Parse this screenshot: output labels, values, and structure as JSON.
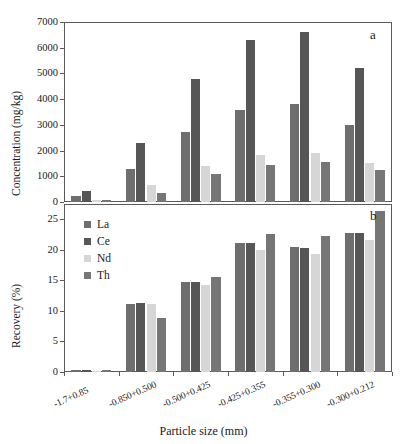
{
  "figure": {
    "width": 407,
    "height": 444,
    "background": "#ffffff",
    "xlabel": "Particle size (mm)"
  },
  "series_colors": {
    "La": "#6e6e6e",
    "Ce": "#565656",
    "Nd": "#d6d6d6",
    "Th": "#767676"
  },
  "legend": {
    "items": [
      {
        "label": "La",
        "color": "#6e6e6e"
      },
      {
        "label": "Ce",
        "color": "#565656"
      },
      {
        "label": "Nd",
        "color": "#d6d6d6"
      },
      {
        "label": "Th",
        "color": "#767676"
      }
    ]
  },
  "panel_a": {
    "label": "a",
    "ylabel": "Concentration (mg/kg)",
    "yticks": [
      "7000",
      "6000",
      "5000",
      "4000",
      "3000",
      "2000",
      "1000",
      "0"
    ]
  },
  "panel_b": {
    "label": "b",
    "ylabel": "Recovery (%)",
    "yticks": [
      "25",
      "20",
      "15",
      "10",
      "5",
      "0"
    ]
  },
  "chart_data": [
    {
      "type": "bar",
      "panel": "a",
      "title": "",
      "xlabel": "Particle size (mm)",
      "ylabel": "Concentration (mg/kg)",
      "ylim": [
        0,
        7000
      ],
      "yticks": [
        0,
        1000,
        2000,
        3000,
        4000,
        5000,
        6000,
        7000
      ],
      "grid": false,
      "legend_position": "none",
      "categories": [
        "-1.7+0.85",
        "-0.850+0.500",
        "-0.500+0.425",
        "-0.425+0.355",
        "-0.355+0.300",
        "-0.300+0.212"
      ],
      "series": [
        {
          "name": "La",
          "color": "#6e6e6e",
          "values": [
            230,
            1270,
            2720,
            3580,
            3800,
            3010
          ]
        },
        {
          "name": "Ce",
          "color": "#565656",
          "values": [
            420,
            2280,
            4780,
            6290,
            6630,
            5210
          ]
        },
        {
          "name": "Nd",
          "color": "#d6d6d6",
          "values": [
            95,
            680,
            1400,
            1810,
            1920,
            1500
          ]
        },
        {
          "name": "Th",
          "color": "#767676",
          "values": [
            60,
            370,
            1080,
            1430,
            1560,
            1250
          ]
        }
      ]
    },
    {
      "type": "bar",
      "panel": "b",
      "title": "",
      "xlabel": "Particle size (mm)",
      "ylabel": "Recovery (%)",
      "ylim": [
        0,
        27.5
      ],
      "yticks": [
        0,
        5,
        10,
        15,
        20,
        25
      ],
      "grid": false,
      "legend_position": "upper-left",
      "categories": [
        "-1.7+0.85",
        "-0.850+0.500",
        "-0.500+0.425",
        "-0.425+0.355",
        "-0.355+0.300",
        "-0.300+0.212"
      ],
      "series": [
        {
          "name": "La",
          "color": "#6e6e6e",
          "values": [
            0.25,
            11.1,
            14.8,
            21.1,
            20.4,
            22.8
          ]
        },
        {
          "name": "Ce",
          "color": "#565656",
          "values": [
            0.25,
            11.3,
            14.8,
            21.1,
            20.3,
            22.7
          ]
        },
        {
          "name": "Nd",
          "color": "#d6d6d6",
          "values": [
            0.2,
            11.1,
            14.2,
            20.0,
            19.3,
            21.6
          ]
        },
        {
          "name": "Th",
          "color": "#767676",
          "values": [
            0.25,
            8.9,
            15.6,
            22.6,
            22.3,
            26.4
          ]
        }
      ]
    }
  ]
}
